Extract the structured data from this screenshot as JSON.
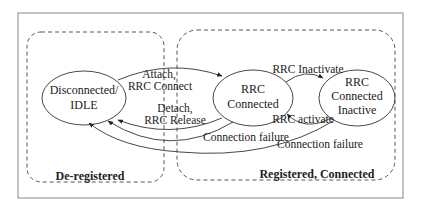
{
  "diagram": {
    "type": "state-machine",
    "colors": {
      "stroke": "#333333",
      "frame": "#888888",
      "text": "#222222",
      "background": "#ffffff"
    },
    "regions": [
      {
        "id": "deregistered",
        "label": "De-registered"
      },
      {
        "id": "registered",
        "label": "Registered, Connected"
      }
    ],
    "states": [
      {
        "id": "idle",
        "line1": "Disconnected/",
        "line2": "IDLE"
      },
      {
        "id": "connected",
        "line1": "RRC",
        "line2": "Connected"
      },
      {
        "id": "inactive",
        "line1": "RRC",
        "line2": "Connected",
        "line3": "Inactive"
      }
    ],
    "transitions": [
      {
        "from": "idle",
        "to": "connected",
        "line1": "Attach,",
        "line2": "RRC Connect"
      },
      {
        "from": "connected",
        "to": "idle",
        "line1": "Detach,",
        "line2": "RRC Release"
      },
      {
        "from": "connected",
        "to": "idle",
        "label": "Connection failure"
      },
      {
        "from": "connected",
        "to": "inactive",
        "label": "RRC Inactivate"
      },
      {
        "from": "inactive",
        "to": "connected",
        "label": "RRC activate"
      },
      {
        "from": "inactive",
        "to": "idle",
        "label": "Connection failure"
      }
    ]
  }
}
